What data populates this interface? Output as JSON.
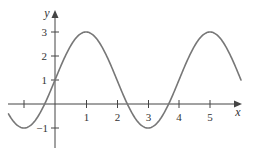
{
  "chart_data": {
    "type": "line",
    "title": "",
    "xlabel": "x",
    "ylabel": "y",
    "function": "y = 1 + 2 sin(pi x / 2)",
    "x_ticks": [
      -1,
      1,
      2,
      3,
      4,
      5
    ],
    "x_tick_labels": [
      "",
      "1",
      "2",
      "3",
      "4",
      "5"
    ],
    "y_ticks": [
      -1,
      1,
      2,
      3
    ],
    "y_tick_labels": [
      "-1",
      "1",
      "2",
      "3"
    ],
    "xlim": [
      -1.5,
      6
    ],
    "ylim": [
      -1.8,
      3.8
    ],
    "grid": false,
    "legend": null,
    "series": [
      {
        "name": "curve",
        "color": "#777777",
        "x": [
          -1.5,
          -1,
          -0.5,
          0,
          0.5,
          1,
          1.5,
          2,
          2.5,
          3,
          3.5,
          4,
          4.5,
          5,
          5.5,
          6
        ],
        "y": [
          -0.41,
          -1,
          -0.41,
          1,
          2.41,
          3,
          2.41,
          1,
          -0.41,
          -1,
          -0.41,
          1,
          2.41,
          3,
          2.41,
          1
        ]
      }
    ],
    "key_points": {
      "maxima": [
        [
          1,
          3
        ],
        [
          5,
          3
        ]
      ],
      "minima": [
        [
          -1,
          -1
        ],
        [
          3,
          -1
        ]
      ],
      "y_intercept": [
        0,
        1
      ]
    }
  },
  "labels": {
    "x_axis": "x",
    "y_axis": "y",
    "x_tick_1": "1",
    "x_tick_2": "2",
    "x_tick_3": "3",
    "x_tick_4": "4",
    "x_tick_5": "5",
    "y_tick_1": "1",
    "y_tick_2": "2",
    "y_tick_3": "3",
    "y_tick_neg1": "−1"
  },
  "colors": {
    "axis": "#444444",
    "curve": "#777777",
    "text": "#333333"
  }
}
